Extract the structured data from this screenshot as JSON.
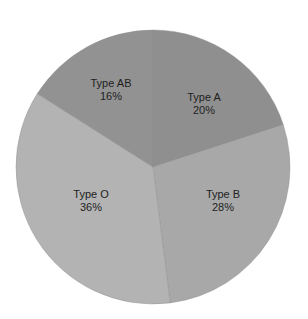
{
  "chart_data": {
    "type": "pie",
    "title": "",
    "categories": [
      "Type A",
      "Type B",
      "Type O",
      "Type AB"
    ],
    "values": [
      20,
      28,
      36,
      16
    ],
    "value_suffix": "%",
    "colors": [
      "#8f8f8f",
      "#a8a8a8",
      "#b3b3b3",
      "#929292"
    ],
    "start_angle_deg": 0,
    "direction": "clockwise",
    "legend": "none",
    "labels_inside": true
  },
  "labels": [
    {
      "name": "Type A",
      "pct": "20%"
    },
    {
      "name": "Type B",
      "pct": "28%"
    },
    {
      "name": "Type O",
      "pct": "36%"
    },
    {
      "name": "Type AB",
      "pct": "16%"
    }
  ]
}
